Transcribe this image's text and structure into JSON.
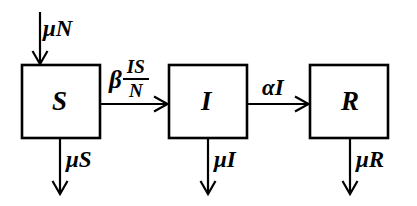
{
  "diagram": {
    "type": "compartmental-flow-diagram",
    "background_color": "#ffffff",
    "stroke_color": "#000000",
    "compartments": [
      {
        "id": "S",
        "label": "S",
        "name": "susceptible",
        "x": 22,
        "y": 65,
        "width": 78,
        "height": 73
      },
      {
        "id": "I",
        "label": "I",
        "name": "infected",
        "x": 169,
        "y": 65,
        "width": 78,
        "height": 73
      },
      {
        "id": "R",
        "label": "R",
        "name": "recovered",
        "x": 310,
        "y": 65,
        "width": 78,
        "height": 73
      }
    ],
    "flows": [
      {
        "id": "birth-into-S",
        "label": "μN",
        "label_plain": "mu N",
        "from": "external",
        "to": "S",
        "direction": "down",
        "kind": "inflow"
      },
      {
        "id": "S-to-I",
        "label_beta": "β",
        "label_numerator": "IS",
        "label_denominator": "N",
        "label_plain": "beta IS / N",
        "from": "S",
        "to": "I",
        "direction": "right",
        "kind": "transition"
      },
      {
        "id": "I-to-R",
        "label": "αI",
        "label_plain": "alpha I",
        "from": "I",
        "to": "R",
        "direction": "right",
        "kind": "transition"
      },
      {
        "id": "death-from-S",
        "label": "μS",
        "label_plain": "mu S",
        "from": "S",
        "to": "external",
        "direction": "down",
        "kind": "outflow"
      },
      {
        "id": "death-from-I",
        "label": "μI",
        "label_plain": "mu I",
        "from": "I",
        "to": "external",
        "direction": "down",
        "kind": "outflow"
      },
      {
        "id": "death-from-R",
        "label": "μR",
        "label_plain": "mu R",
        "from": "R",
        "to": "external",
        "direction": "down",
        "kind": "outflow"
      }
    ]
  }
}
